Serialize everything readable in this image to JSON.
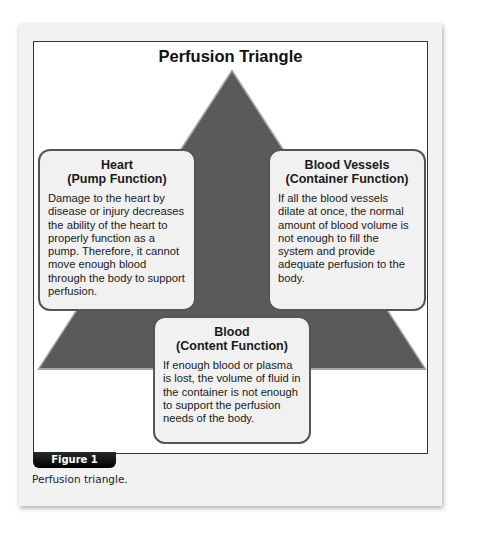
{
  "diagram": {
    "title": "Perfusion Triangle",
    "shape": "triangle",
    "triangle_color": "#5a5a5a",
    "boxes": [
      {
        "id": "heart",
        "heading_line1": "Heart",
        "heading_line2": "(Pump Function)",
        "body": "Damage to the heart by disease or injury decreases the ability of the heart to properly function as a pump. Therefore, it cannot move enough blood through the body to support perfusion."
      },
      {
        "id": "blood-vessels",
        "heading_line1": "Blood Vessels",
        "heading_line2": "(Container Function)",
        "body": "If all the blood vessels dilate at once, the normal amount of blood volume is not enough to fill the system and provide adequate perfusion to the body."
      },
      {
        "id": "blood",
        "heading_line1": "Blood",
        "heading_line2": "(Content Function)",
        "body": "If enough blood or plasma is lost, the volume of fluid in the container is not enough to support the perfusion needs of the body."
      }
    ]
  },
  "figure": {
    "label": "Figure 1",
    "caption": "Perfusion triangle."
  }
}
